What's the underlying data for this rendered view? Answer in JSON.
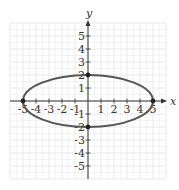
{
  "chart_data": {
    "type": "line",
    "title": "",
    "xlabel": "x",
    "ylabel": "y",
    "xlim": [
      -6,
      6
    ],
    "ylim": [
      -6,
      6
    ],
    "grid": true,
    "x_ticks": [
      -5,
      -4,
      -3,
      -2,
      -1,
      1,
      2,
      3,
      4,
      5
    ],
    "y_ticks": [
      -5,
      -4,
      -3,
      -2,
      -1,
      1,
      2,
      3,
      4,
      5
    ],
    "x_tick_labels": [
      "-5",
      "-4",
      "-3",
      "-2",
      "-1",
      "1",
      "2",
      "3",
      "4",
      "5"
    ],
    "y_tick_labels": [
      "-5",
      "-4",
      "-3",
      "-2",
      "-1",
      "1",
      "2",
      "3",
      "4",
      "5"
    ],
    "series": [
      {
        "name": "ellipse",
        "shape": "ellipse",
        "center": [
          0,
          0
        ],
        "semi_major_x": 5,
        "semi_minor_y": 2,
        "equation": "x^2/25 + y^2/4 = 1",
        "color": "#555555"
      }
    ],
    "marked_points": [
      {
        "x": -5,
        "y": 0
      },
      {
        "x": 5,
        "y": 0
      },
      {
        "x": 0,
        "y": 2
      },
      {
        "x": 0,
        "y": -2
      }
    ],
    "legend": null
  },
  "colors": {
    "grid": "#e6e6e6",
    "axis": "#333333",
    "curve": "#555555",
    "point": "#222222"
  },
  "geometry": {
    "origin_x": 88,
    "origin_y": 101,
    "unit_px": 13
  }
}
